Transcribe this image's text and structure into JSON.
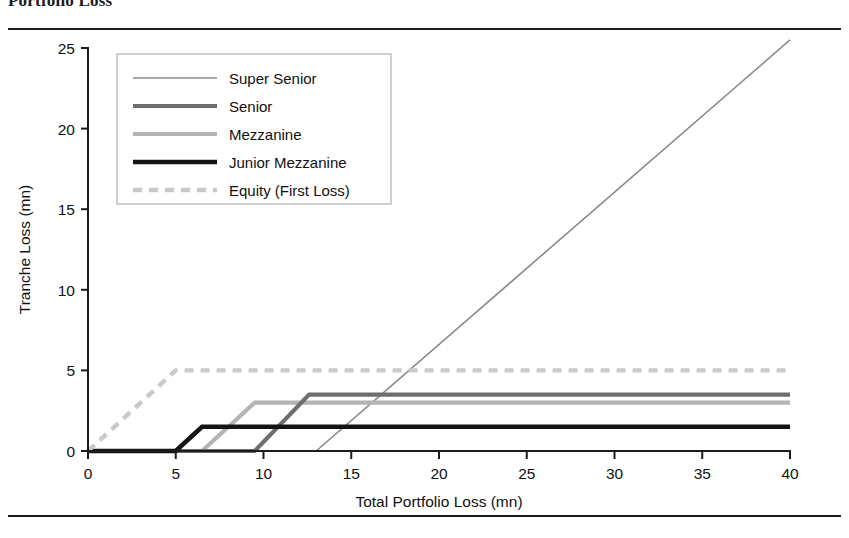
{
  "figure": {
    "caption": "Portfolio Loss",
    "rules": {
      "top_label": "top-rule",
      "bottom_label": "bottom-rule"
    }
  },
  "chart_data": {
    "type": "line",
    "title": "Portfolio Loss",
    "xlabel": "Total Portfolio Loss (mn)",
    "ylabel": "Tranche Loss (mn)",
    "xlim": [
      0,
      40
    ],
    "ylim": [
      0,
      25
    ],
    "xticks": [
      0,
      5,
      10,
      15,
      20,
      25,
      30,
      35,
      40
    ],
    "yticks": [
      0,
      5,
      10,
      15,
      20,
      25
    ],
    "xtick_labels": [
      "0",
      "5",
      "10",
      "15",
      "20",
      "25",
      "30",
      "35",
      "40"
    ],
    "ytick_labels": [
      "0",
      "5",
      "10",
      "15",
      "20",
      "25"
    ],
    "grid": false,
    "legend_position": "upper-left-inside",
    "series": [
      {
        "name": "Super Senior",
        "color": "#8a8a8a",
        "width": 1.6,
        "dash": "none",
        "attachment": 13.0,
        "detachment": 40.0,
        "cap": 25.5,
        "x": [
          0,
          13,
          40
        ],
        "y": [
          0,
          0,
          25.5
        ]
      },
      {
        "name": "Senior",
        "color": "#6e6e6e",
        "width": 4.2,
        "dash": "none",
        "attachment": 9.5,
        "detachment": 12.6,
        "cap": 3.5,
        "x": [
          0,
          9.5,
          12.6,
          40
        ],
        "y": [
          0,
          0,
          3.5,
          3.5
        ]
      },
      {
        "name": "Mezzanine",
        "color": "#b4b4b4",
        "width": 4.2,
        "dash": "none",
        "attachment": 6.5,
        "detachment": 9.5,
        "cap": 3.0,
        "x": [
          0,
          6.5,
          9.5,
          40
        ],
        "y": [
          0,
          0,
          3.0,
          3.0
        ]
      },
      {
        "name": "Junior Mezzanine",
        "color": "#141414",
        "width": 4.6,
        "dash": "none",
        "attachment": 5.0,
        "detachment": 6.5,
        "cap": 1.5,
        "x": [
          0,
          5.0,
          6.5,
          40
        ],
        "y": [
          0,
          0,
          1.5,
          1.5
        ]
      },
      {
        "name": "Equity (First Loss)",
        "color": "#c9c9c9",
        "width": 4.4,
        "dash": "9 7",
        "attachment": 0.0,
        "detachment": 5.0,
        "cap": 5.0,
        "x": [
          0,
          5.0,
          40
        ],
        "y": [
          0,
          5.0,
          5.0
        ]
      }
    ],
    "legend_entries": [
      {
        "label": "Super Senior",
        "color": "#8a8a8a",
        "width": 1.6,
        "dash": "none"
      },
      {
        "label": "Senior",
        "color": "#6e6e6e",
        "width": 4.2,
        "dash": "none"
      },
      {
        "label": "Mezzanine",
        "color": "#b4b4b4",
        "width": 4.2,
        "dash": "none"
      },
      {
        "label": "Junior Mezzanine",
        "color": "#141414",
        "width": 4.6,
        "dash": "none"
      },
      {
        "label": "Equity (First Loss)",
        "color": "#c9c9c9",
        "width": 4.4,
        "dash": "9 7"
      }
    ]
  }
}
